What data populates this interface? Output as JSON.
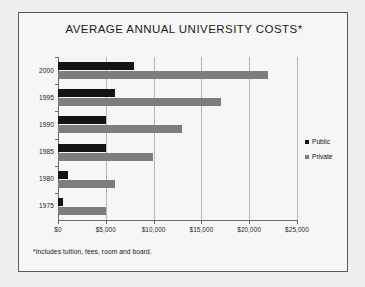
{
  "chart_data": {
    "type": "bar",
    "orientation": "horizontal",
    "title": "AVERAGE ANNUAL UNIVERSITY COSTS*",
    "xlabel": "",
    "ylabel": "",
    "categories": [
      "2000",
      "1995",
      "1990",
      "1985",
      "1980",
      "1975"
    ],
    "series": [
      {
        "name": "Public",
        "color": "#141414",
        "values": [
          8000,
          6000,
          5000,
          5000,
          1000,
          500
        ]
      },
      {
        "name": "Private",
        "color": "#7d7d7d",
        "values": [
          22000,
          17000,
          13000,
          9900,
          6000,
          5000
        ]
      }
    ],
    "xlim": [
      0,
      25000
    ],
    "xticks": [
      0,
      5000,
      10000,
      15000,
      20000,
      25000
    ],
    "xtick_labels": [
      "$0",
      "$5,000",
      "$10,000",
      "$15,000",
      "$20,000",
      "$25,000"
    ],
    "grid": true,
    "grid_axis": "x",
    "legend_position": "right",
    "footnote": "*Includes tuition, fees, room and board."
  },
  "legend": {
    "items": [
      {
        "label": "Public",
        "color": "#141414"
      },
      {
        "label": "Private",
        "color": "#7d7d7d"
      }
    ]
  },
  "colors": {
    "public": "#141414",
    "private": "#7d7d7d",
    "frame_border": "#5a5a5a",
    "gridline": "#b5b5b5",
    "axis": "#6a6a6a",
    "background": "#f2f2f2",
    "plot_background": "#f6f6f6",
    "text": "#1a1a1a"
  }
}
